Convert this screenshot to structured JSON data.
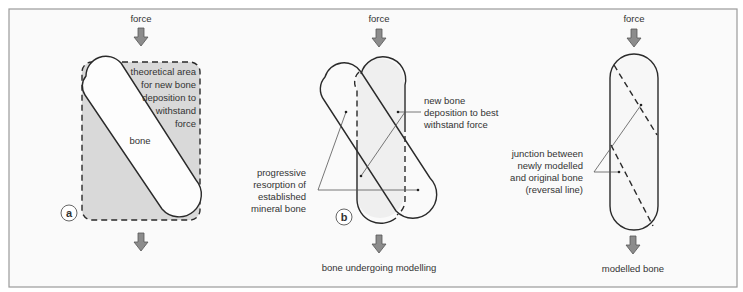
{
  "figure": {
    "colors": {
      "background": "#ffffff",
      "panel_fill": "#fafafa",
      "frame": "#9a9a9a",
      "shade": "#d9d9d9",
      "light_shade": "#efefef",
      "outline": "#2a2a2a",
      "arrow_fill": "#8c8c8c",
      "text": "#333333"
    },
    "panels": [
      {
        "id": "a",
        "letter": "a",
        "force_label": "force",
        "area_label_lines": [
          "theoretical area",
          "for new bone",
          "deposition to",
          "withstand",
          "force"
        ],
        "bone_label": "bone",
        "caption": ""
      },
      {
        "id": "b",
        "letter": "b",
        "force_label": "force",
        "deposition_label_lines": [
          "new bone",
          "deposition to best",
          "withstand force"
        ],
        "resorption_label_lines": [
          "progressive",
          "resorption of",
          "established",
          "mineral bone"
        ],
        "caption": "bone undergoing modelling"
      },
      {
        "id": "c",
        "letter": "",
        "force_label": "force",
        "junction_label_lines": [
          "junction between",
          "newly modelled",
          "and original bone",
          "(reversal line)"
        ],
        "caption": "modelled bone"
      }
    ]
  }
}
